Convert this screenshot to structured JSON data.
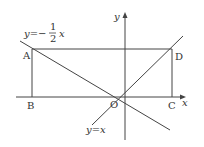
{
  "diagram": {
    "axes": {
      "x_label": "x",
      "y_label": "y",
      "origin_label": "O"
    },
    "points": {
      "A": "A",
      "B": "B",
      "C": "C",
      "D": "D"
    },
    "lines": {
      "neg_half": {
        "prefix": "y=−",
        "num": "1",
        "den": "2",
        "suffix": "x"
      },
      "identity": "y=x"
    },
    "colors": {
      "stroke": "#333333",
      "background": "#ffffff"
    }
  }
}
